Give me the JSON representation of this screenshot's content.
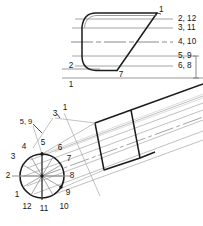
{
  "drawing": {
    "title": "Pipe miter development",
    "background_color": "#ffffff",
    "ink_color": "#141414",
    "construction_color": "#9a9a9a",
    "light_construction_color": "#b8b8b8"
  },
  "top_view": {
    "name": "elevation-view",
    "element_labels": [
      {
        "text": "1",
        "x": 159,
        "y": 10
      },
      {
        "text": "2, 12",
        "x": 178,
        "y": 19
      },
      {
        "text": "3, 11",
        "x": 178,
        "y": 28
      },
      {
        "text": "4, 10",
        "x": 178,
        "y": 42
      },
      {
        "text": "5, 9",
        "x": 178,
        "y": 56
      },
      {
        "text": "6, 8",
        "x": 178,
        "y": 66
      }
    ],
    "base_labels": [
      {
        "text": "2",
        "x": 71,
        "y": 70
      },
      {
        "text": "7",
        "x": 121,
        "y": 73
      },
      {
        "text": "1",
        "x": 71,
        "y": 84
      }
    ],
    "element_line_ys": [
      19,
      28,
      42,
      56,
      66
    ],
    "center_line_y": 42,
    "baseline_y": 78
  },
  "bottom_view": {
    "name": "pictorial-view",
    "circle": {
      "center_x": 42,
      "center_y": 176,
      "radius": 22,
      "divisions": 12
    },
    "clock_labels": [
      {
        "text": "1",
        "x": 17,
        "y": 195
      },
      {
        "text": "2",
        "x": 8,
        "y": 176
      },
      {
        "text": "3",
        "x": 13,
        "y": 157
      },
      {
        "text": "4",
        "x": 24,
        "y": 147
      },
      {
        "text": "5",
        "x": 43,
        "y": 143
      },
      {
        "text": "6",
        "x": 60,
        "y": 148
      },
      {
        "text": "7",
        "x": 69,
        "y": 159
      },
      {
        "text": "8",
        "x": 72,
        "y": 176
      },
      {
        "text": "9",
        "x": 68,
        "y": 193
      },
      {
        "text": "10",
        "x": 63,
        "y": 207
      },
      {
        "text": "11",
        "x": 44,
        "y": 209
      },
      {
        "text": "12",
        "x": 27,
        "y": 207
      }
    ],
    "leader_labels": [
      {
        "text": "1",
        "x": 65,
        "y": 108
      },
      {
        "text": "3",
        "x": 55,
        "y": 114
      },
      {
        "text": "5, 9",
        "x": 26,
        "y": 122
      }
    ]
  }
}
